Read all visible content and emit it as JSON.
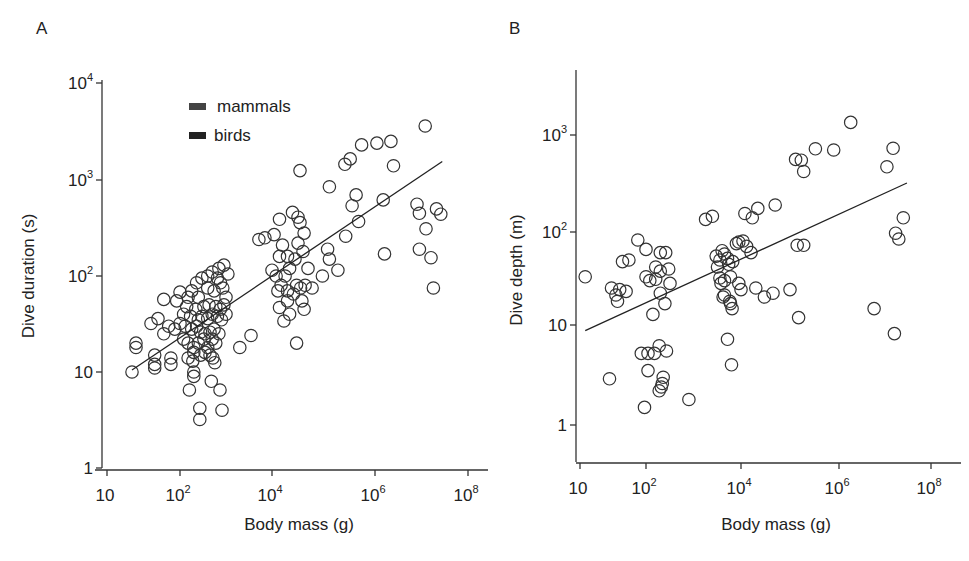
{
  "chart_data": [
    {
      "panel": "A",
      "type": "scatter",
      "title": "",
      "xlabel": "Body mass (g)",
      "ylabel": "Dive duration (s)",
      "xscale": "log",
      "yscale": "log",
      "xlim": [
        10,
        100000000
      ],
      "ylim": [
        1,
        10000
      ],
      "x_ticks": [
        10,
        100,
        10000,
        1000000,
        100000000
      ],
      "x_tick_labels": [
        {
          "base": "10",
          "exp": ""
        },
        {
          "base": "10",
          "exp": "2"
        },
        {
          "base": "10",
          "exp": "4"
        },
        {
          "base": "10",
          "exp": "6"
        },
        {
          "base": "10",
          "exp": "8"
        }
      ],
      "y_ticks": [
        1,
        10,
        100,
        1000,
        10000
      ],
      "y_tick_labels": [
        {
          "base": "1",
          "exp": ""
        },
        {
          "base": "10",
          "exp": ""
        },
        {
          "base": "10",
          "exp": "2"
        },
        {
          "base": "10",
          "exp": "3"
        },
        {
          "base": "10",
          "exp": "4"
        }
      ],
      "grid": false,
      "legend": {
        "position": "upper-left",
        "entries": [
          {
            "label": "mammals",
            "swatch": "#444444"
          },
          {
            "label": "birds",
            "swatch": "#222222"
          }
        ]
      },
      "fit_line": {
        "x": [
          22,
          28000000
        ],
        "y": [
          10.5,
          1550
        ]
      },
      "pixel_map": {
        "x_ticks_px": [
          107,
          180,
          272,
          375,
          468
        ],
        "y_ticks_px": [
          468,
          372,
          276,
          180,
          83
        ]
      },
      "points": [
        [
          12000000,
          3600
        ],
        [
          260000,
          1450
        ],
        [
          330000,
          1650
        ],
        [
          550000,
          2300
        ],
        [
          1100000,
          2400
        ],
        [
          2200000,
          2500
        ],
        [
          2500000,
          1400
        ],
        [
          35000,
          1250
        ],
        [
          130000,
          850
        ],
        [
          430000,
          700
        ],
        [
          360000,
          540
        ],
        [
          1500000,
          620
        ],
        [
          8000000,
          560
        ],
        [
          9000000,
          450
        ],
        [
          21000000,
          500
        ],
        [
          26000000,
          440
        ],
        [
          12500000,
          310
        ],
        [
          9000000,
          190
        ],
        [
          16000000,
          155
        ],
        [
          18000000,
          75
        ],
        [
          1600000,
          170
        ],
        [
          120000,
          190
        ],
        [
          480000,
          370
        ],
        [
          270000,
          260
        ],
        [
          25000,
          460
        ],
        [
          32000,
          410
        ],
        [
          35000,
          360
        ],
        [
          14000,
          390
        ],
        [
          11000,
          270
        ],
        [
          7000,
          250
        ],
        [
          5200,
          240
        ],
        [
          16000,
          210
        ],
        [
          14000,
          160
        ],
        [
          20000,
          160
        ],
        [
          32000,
          220
        ],
        [
          42000,
          280
        ],
        [
          40000,
          180
        ],
        [
          28000,
          150
        ],
        [
          50000,
          120
        ],
        [
          22000,
          120
        ],
        [
          18000,
          100
        ],
        [
          12000,
          100
        ],
        [
          10000,
          115
        ],
        [
          15000,
          80
        ],
        [
          30000,
          80
        ],
        [
          36000,
          75
        ],
        [
          44000,
          80
        ],
        [
          60000,
          75
        ],
        [
          95000,
          100
        ],
        [
          190000,
          115
        ],
        [
          130000,
          150
        ],
        [
          13000,
          70
        ],
        [
          20000,
          70
        ],
        [
          26000,
          65
        ],
        [
          14000,
          47
        ],
        [
          20000,
          55
        ],
        [
          38000,
          55
        ],
        [
          22000,
          40
        ],
        [
          17000,
          34
        ],
        [
          42000,
          45
        ],
        [
          30000,
          20
        ],
        [
          3500,
          24
        ],
        [
          2000,
          18
        ],
        [
          900,
          130
        ],
        [
          700,
          120
        ],
        [
          500,
          110
        ],
        [
          650,
          95
        ],
        [
          400,
          100
        ],
        [
          1100,
          105
        ],
        [
          760,
          85
        ],
        [
          300,
          95
        ],
        [
          230,
          85
        ],
        [
          180,
          70
        ],
        [
          100,
          68
        ],
        [
          150,
          60
        ],
        [
          250,
          60
        ],
        [
          400,
          75
        ],
        [
          550,
          70
        ],
        [
          850,
          75
        ],
        [
          1000,
          60
        ],
        [
          60,
          57
        ],
        [
          90,
          55
        ],
        [
          140,
          48
        ],
        [
          220,
          45
        ],
        [
          330,
          48
        ],
        [
          430,
          50
        ],
        [
          600,
          48
        ],
        [
          750,
          45
        ],
        [
          900,
          50
        ],
        [
          1000,
          40
        ],
        [
          120,
          40
        ],
        [
          170,
          38
        ],
        [
          250,
          35
        ],
        [
          300,
          38
        ],
        [
          400,
          36
        ],
        [
          500,
          40
        ],
        [
          650,
          38
        ],
        [
          800,
          35
        ],
        [
          50,
          36
        ],
        [
          40,
          32
        ],
        [
          70,
          30
        ],
        [
          100,
          32
        ],
        [
          130,
          30
        ],
        [
          180,
          28
        ],
        [
          230,
          30
        ],
        [
          280,
          26
        ],
        [
          350,
          25
        ],
        [
          450,
          26
        ],
        [
          550,
          28
        ],
        [
          700,
          25
        ],
        [
          85,
          28
        ],
        [
          60,
          25
        ],
        [
          120,
          22
        ],
        [
          150,
          20
        ],
        [
          200,
          18
        ],
        [
          250,
          20
        ],
        [
          330,
          22
        ],
        [
          400,
          18
        ],
        [
          500,
          22
        ],
        [
          600,
          20
        ],
        [
          200,
          16
        ],
        [
          280,
          15
        ],
        [
          350,
          16
        ],
        [
          450,
          15
        ],
        [
          150,
          14
        ],
        [
          25,
          20
        ],
        [
          25,
          18
        ],
        [
          45,
          15
        ],
        [
          45,
          12
        ],
        [
          75,
          14
        ],
        [
          75,
          12
        ],
        [
          22,
          10
        ],
        [
          45,
          11
        ],
        [
          190,
          13
        ],
        [
          200,
          10
        ],
        [
          200,
          9
        ],
        [
          520,
          14
        ],
        [
          570,
          12.5
        ],
        [
          160,
          6.5
        ],
        [
          480,
          8
        ],
        [
          740,
          6.5
        ],
        [
          270,
          4.2
        ],
        [
          270,
          3.2
        ],
        [
          820,
          4.0
        ]
      ]
    },
    {
      "panel": "B",
      "type": "scatter",
      "title": "",
      "xlabel": "Body mass (g)",
      "ylabel": "Dive depth (m)",
      "xscale": "log",
      "yscale": "log",
      "xlim": [
        10,
        100000000
      ],
      "ylim": [
        0.4,
        5000
      ],
      "x_ticks": [
        10,
        100,
        10000,
        1000000,
        100000000
      ],
      "x_tick_labels": [
        {
          "base": "10",
          "exp": ""
        },
        {
          "base": "10",
          "exp": "2"
        },
        {
          "base": "10",
          "exp": "4"
        },
        {
          "base": "10",
          "exp": "6"
        },
        {
          "base": "10",
          "exp": "8"
        }
      ],
      "y_ticks": [
        1,
        10,
        100,
        1000
      ],
      "y_tick_labels": [
        {
          "base": "1",
          "exp": ""
        },
        {
          "base": "10",
          "exp": ""
        },
        {
          "base": "10",
          "exp": "2"
        },
        {
          "base": "10",
          "exp": "3"
        }
      ],
      "grid": false,
      "fit_line": {
        "x": [
          12,
          30000000
        ],
        "y": [
          8.8,
          320
        ]
      },
      "pixel_map": {
        "x_ticks_px": [
          580,
          646,
          741,
          839,
          931
        ],
        "y_ticks_px": [
          425,
          325,
          232,
          135
        ]
      },
      "points": [
        [
          1800000,
          1350
        ],
        [
          130000,
          560
        ],
        [
          170000,
          550
        ],
        [
          190000,
          420
        ],
        [
          330000,
          720
        ],
        [
          780000,
          700
        ],
        [
          11000000,
          470
        ],
        [
          15000000,
          730
        ],
        [
          25000000,
          140
        ],
        [
          17000000,
          97
        ],
        [
          20000000,
          84
        ],
        [
          140000,
          72
        ],
        [
          190000,
          72
        ],
        [
          50000,
          190
        ],
        [
          22000,
          175
        ],
        [
          17000,
          140
        ],
        [
          12000,
          155
        ],
        [
          1800,
          135
        ],
        [
          2500,
          145
        ],
        [
          75,
          82
        ],
        [
          100,
          65
        ],
        [
          44,
          48
        ],
        [
          55,
          50
        ],
        [
          200,
          60
        ],
        [
          260,
          60
        ],
        [
          160,
          42
        ],
        [
          200,
          38
        ],
        [
          12,
          33
        ],
        [
          100,
          33
        ],
        [
          120,
          30
        ],
        [
          300,
          40
        ],
        [
          3000,
          55
        ],
        [
          4000,
          63
        ],
        [
          4500,
          58
        ],
        [
          5200,
          52
        ],
        [
          5500,
          45
        ],
        [
          6000,
          33
        ],
        [
          6700,
          48
        ],
        [
          8000,
          75
        ],
        [
          9000,
          78
        ],
        [
          11000,
          80
        ],
        [
          13000,
          70
        ],
        [
          16000,
          60
        ],
        [
          3800,
          28
        ],
        [
          4500,
          30
        ],
        [
          5800,
          18
        ],
        [
          9000,
          28
        ],
        [
          10000,
          24
        ],
        [
          20000,
          25
        ],
        [
          30000,
          20
        ],
        [
          45000,
          22
        ],
        [
          100000,
          24
        ],
        [
          3200,
          42
        ],
        [
          3600,
          50
        ],
        [
          30,
          25
        ],
        [
          40,
          24
        ],
        [
          50,
          23
        ],
        [
          35,
          21
        ],
        [
          37,
          18
        ],
        [
          160,
          31
        ],
        [
          320,
          28
        ],
        [
          200,
          22
        ],
        [
          250,
          17
        ],
        [
          140,
          13
        ],
        [
          3600,
          32
        ],
        [
          4200,
          20
        ],
        [
          4500,
          21
        ],
        [
          6000,
          17
        ],
        [
          6500,
          15
        ],
        [
          150000,
          12
        ],
        [
          5800000,
          15
        ],
        [
          16000000,
          8.2
        ],
        [
          5200,
          7.2
        ],
        [
          6300,
          4.0
        ],
        [
          85,
          5.2
        ],
        [
          110,
          5.2
        ],
        [
          150,
          5.2
        ],
        [
          190,
          6.2
        ],
        [
          270,
          5.5
        ],
        [
          110,
          3.5
        ],
        [
          230,
          3.0
        ],
        [
          220,
          2.6
        ],
        [
          210,
          2.4
        ],
        [
          190,
          2.2
        ],
        [
          28,
          2.9
        ],
        [
          95,
          1.5
        ],
        [
          800,
          1.8
        ]
      ]
    }
  ],
  "panels": {
    "a": {
      "label": "A",
      "ylabel": "Dive duration (s)",
      "xlabel": "Body mass (g)"
    },
    "b": {
      "label": "B",
      "ylabel": "Dive depth (m)",
      "xlabel": "Body mass (g)"
    }
  },
  "legend": {
    "items": [
      {
        "label": "mammals"
      },
      {
        "label": "birds"
      }
    ]
  }
}
